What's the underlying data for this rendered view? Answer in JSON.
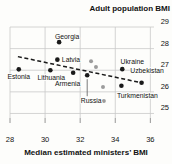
{
  "title": "Adult population BMI",
  "x_axis_label": "Median estimated ministers’ BMI",
  "colors": {
    "background": "#fdfdfb",
    "gridline": "#c9c9c9",
    "labeled_point": "#1a1a1a",
    "unlabeled_point": "#9c9c9c",
    "trend_line": "#1a1a1a",
    "text": "#121212"
  },
  "chart_data": {
    "type": "scatter",
    "title": "Adult population BMI",
    "xlabel": "Median estimated ministers’ BMI",
    "ylabel": "Adult population BMI",
    "xlim": [
      28,
      36.55
    ],
    "ylim": [
      24.79,
      29
    ],
    "x_ticks": [
      28,
      30,
      32,
      34,
      36
    ],
    "y_ticks": [
      25,
      26,
      27,
      28,
      29
    ],
    "grid": true,
    "y_axis_side": "right",
    "trend_line": {
      "style": "dashed",
      "x_start": 28.45,
      "y_start": 27.63,
      "x_end": 35.5,
      "y_end": 26.42
    },
    "series": [
      {
        "name": "Labeled countries",
        "color": "#1a1a1a",
        "radius": 2.3,
        "points": [
          {
            "label": "Georgia",
            "x": 30.8,
            "y": 28.3,
            "anchor": "middle",
            "dx": 8,
            "dy": -3.5
          },
          {
            "label": "Latvia",
            "x": 30.7,
            "y": 27.49,
            "anchor": "start",
            "dx": 4.5,
            "dy": 2
          },
          {
            "label": "Estonia",
            "x": 28.5,
            "y": 27.04,
            "anchor": "middle",
            "dx": 0,
            "dy": 10
          },
          {
            "label": "Lithuania",
            "x": 30.3,
            "y": 27.0,
            "anchor": "middle",
            "dx": 1,
            "dy": 10
          },
          {
            "label": "Armenia",
            "x": 31.6,
            "y": 26.88,
            "anchor": "middle",
            "dx": -5.5,
            "dy": 13.5
          },
          {
            "label": "Russia",
            "x": 32.4,
            "y": 26.77,
            "anchor": "middle",
            "dx": 4,
            "dy": 28,
            "leader": true
          },
          {
            "label": "Ukraine",
            "x": 34.4,
            "y": 27.05,
            "anchor": "middle",
            "dx": 10,
            "dy": -5
          },
          {
            "label": "Uzbekistan",
            "x": 35.5,
            "y": 26.42,
            "anchor": "middle",
            "dx": 5.5,
            "dy": -10
          },
          {
            "label": "Turkmenistan",
            "x": 34.35,
            "y": 26.28,
            "anchor": "middle",
            "dx": 16,
            "dy": 12
          }
        ]
      },
      {
        "name": "Unlabeled countries",
        "color": "#9c9c9c",
        "radius": 2,
        "points": [
          {
            "label": "",
            "x": 32.62,
            "y": 27.42
          },
          {
            "label": "",
            "x": 32.9,
            "y": 27.15
          },
          {
            "label": "",
            "x": 33.3,
            "y": 26.22
          },
          {
            "label": "",
            "x": 33.35,
            "y": 25.58
          }
        ]
      }
    ]
  }
}
